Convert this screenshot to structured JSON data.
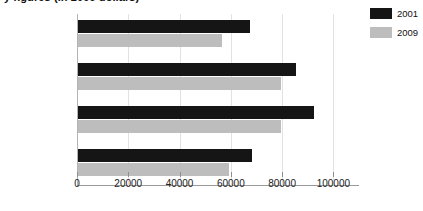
{
  "chart_data": {
    "type": "bar",
    "orientation": "horizontal",
    "title": "y figures (in 2009 dollars)",
    "xlabel": "",
    "ylabel": "",
    "categories": [
      "Direct service",
      "Full professor",
      "Applied",
      "Researcher"
    ],
    "series": [
      {
        "name": "2001",
        "color": "#151515",
        "values": [
          67000,
          85000,
          92000,
          68000
        ]
      },
      {
        "name": "2009",
        "color": "#bdbdbd",
        "values": [
          56000,
          79000,
          79000,
          59000
        ]
      }
    ],
    "xlim": [
      0,
      110000
    ],
    "xticks": [
      0,
      20000,
      40000,
      60000,
      80000,
      100000
    ],
    "xtick_labels": [
      "0",
      "20000",
      "40000",
      "60000",
      "80000",
      "100000"
    ],
    "grid": true,
    "legend_position": "top-right"
  }
}
